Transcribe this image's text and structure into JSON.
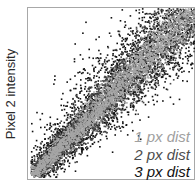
{
  "chart_data": {
    "type": "scatter",
    "title": "",
    "xlabel": "",
    "ylabel": "Pixel 2 intensity",
    "grid": false,
    "legend_position": "inside-bottom-right",
    "series": [
      {
        "name": "1 px dist",
        "color": "#a6a6a6",
        "description": "narrow band along diagonal (highest correlation)",
        "band_halfwidth_rel": 0.1
      },
      {
        "name": "2 px dist",
        "color": "#4a4a4a",
        "description": "medium band along diagonal",
        "band_halfwidth_rel": 0.17
      },
      {
        "name": "3 px dist",
        "color": "#111111",
        "description": "widest band along diagonal with scattered outliers",
        "band_halfwidth_rel": 0.25
      }
    ],
    "x_range": [
      0,
      1
    ],
    "y_range": [
      0,
      1
    ]
  },
  "axis": {
    "ylabel": "Pixel 2 intensity"
  },
  "legend": [
    {
      "label": "1 px dist",
      "color": "#a0a0a0"
    },
    {
      "label": "2 px dist",
      "color": "#4d4d4d"
    },
    {
      "label": "3 px dist",
      "color": "#111111"
    }
  ]
}
